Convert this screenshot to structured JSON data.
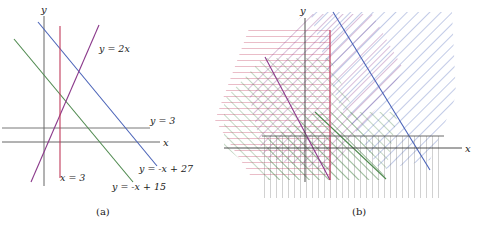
{
  "figure": {
    "kind": "math-figure",
    "background_color": "#ffffff"
  },
  "captions": {
    "a": "(a)",
    "b": "(b)"
  },
  "axis_labels": {
    "x": "x",
    "y": "y"
  },
  "colors": {
    "axis": "#555555",
    "line_y_eq_2x": "#8b3a8b",
    "line_x_eq_3": "#c0395a",
    "line_y_eq_3": "#6a6a6a",
    "line_y_eq_minus_x_plus_15": "#4f8a4f",
    "line_y_eq_minus_x_plus_27": "#4a63b8",
    "text": "#1a1a1a"
  },
  "panel_a": {
    "name": "plain-lines-panel",
    "lines": [
      {
        "id": "y-eq-2x",
        "label": "y = 2x",
        "color": "#8b3a8b",
        "slope": 2,
        "intercept": 0,
        "label_pos": {
          "x": 99,
          "y": 52
        }
      },
      {
        "id": "x-eq-3",
        "label": "x = 3",
        "color": "#c0395a",
        "vertical_at_x": 3,
        "label_pos": {
          "x": 60,
          "y": 181
        }
      },
      {
        "id": "y-eq-3",
        "label": "y = 3",
        "color": "#6a6a6a",
        "slope": 0,
        "intercept": 3,
        "label_pos": {
          "x": 152,
          "y": 124
        }
      },
      {
        "id": "y-eq-minus-x-plus-15",
        "label": "y = -x + 15",
        "color": "#4f8a4f",
        "slope": -1,
        "intercept": 15,
        "label_pos": {
          "x": 113,
          "y": 189
        }
      },
      {
        "id": "y-eq-minus-x-plus-27",
        "label": "y = -x + 27",
        "color": "#4a63b8",
        "slope": -1,
        "intercept": 27,
        "label_pos": {
          "x": 140,
          "y": 172
        }
      }
    ]
  },
  "panel_b": {
    "name": "hatched-halfplanes-panel",
    "regions": [
      {
        "id": "region-y-le-2x",
        "color": "#8b3a8b",
        "hatch": "diagonal-backslash"
      },
      {
        "id": "region-x-ge-3",
        "color": "#c0395a",
        "hatch": "horizontal"
      },
      {
        "id": "region-y-ge-3",
        "color": "#6a6a6a",
        "hatch": "vertical"
      },
      {
        "id": "region-y-ge-minus-x-15",
        "color": "#4f8a4f",
        "hatch": "diagonal-slash"
      },
      {
        "id": "region-y-le-minus-x-27",
        "color": "#4a63b8",
        "hatch": "diagonal-backslash-wide"
      }
    ]
  }
}
